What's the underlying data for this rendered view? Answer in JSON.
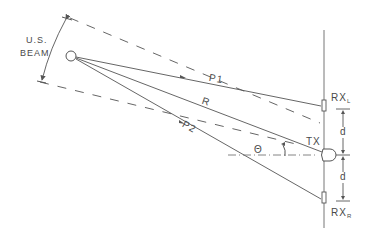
{
  "diagram": {
    "beam_label_line1": "U.S.",
    "beam_label_line2": "BEAM",
    "path_labels": {
      "p1": "P1",
      "r": "R",
      "p2": "P2"
    },
    "angle_label": "Θ",
    "tx_label": "TX",
    "rx_left": {
      "main": "RX",
      "sub": "L"
    },
    "rx_right": {
      "main": "RX",
      "sub": "R"
    },
    "spacing_label_upper": "d",
    "spacing_label_lower": "d",
    "line_color": "#555555",
    "text_color": "#4a4a4a"
  }
}
